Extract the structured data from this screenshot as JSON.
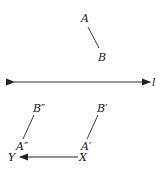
{
  "diagram": {
    "line_label": "l",
    "points": {
      "A": {
        "label": "A"
      },
      "B": {
        "label": "B"
      },
      "A_prime": {
        "label": "A′"
      },
      "B_prime": {
        "label": "B′"
      },
      "A_double": {
        "label": "A″"
      },
      "B_double": {
        "label": "B″"
      },
      "X": {
        "label": "X"
      },
      "Y": {
        "label": "Y"
      }
    },
    "colors": {
      "stroke": "#333333",
      "text": "#222222"
    }
  }
}
